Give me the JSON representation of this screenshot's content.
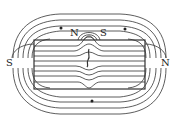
{
  "diagram": {
    "labels": {
      "left_pole": "S",
      "right_pole": "N",
      "crack_north": "N",
      "crack_south": "S"
    },
    "colors": {
      "line": "#333333",
      "background": "#ffffff"
    },
    "arrows": [
      {
        "position": "top-left",
        "direction": "left"
      },
      {
        "position": "top-right",
        "direction": "left"
      },
      {
        "position": "bottom-center",
        "direction": "left"
      }
    ]
  }
}
